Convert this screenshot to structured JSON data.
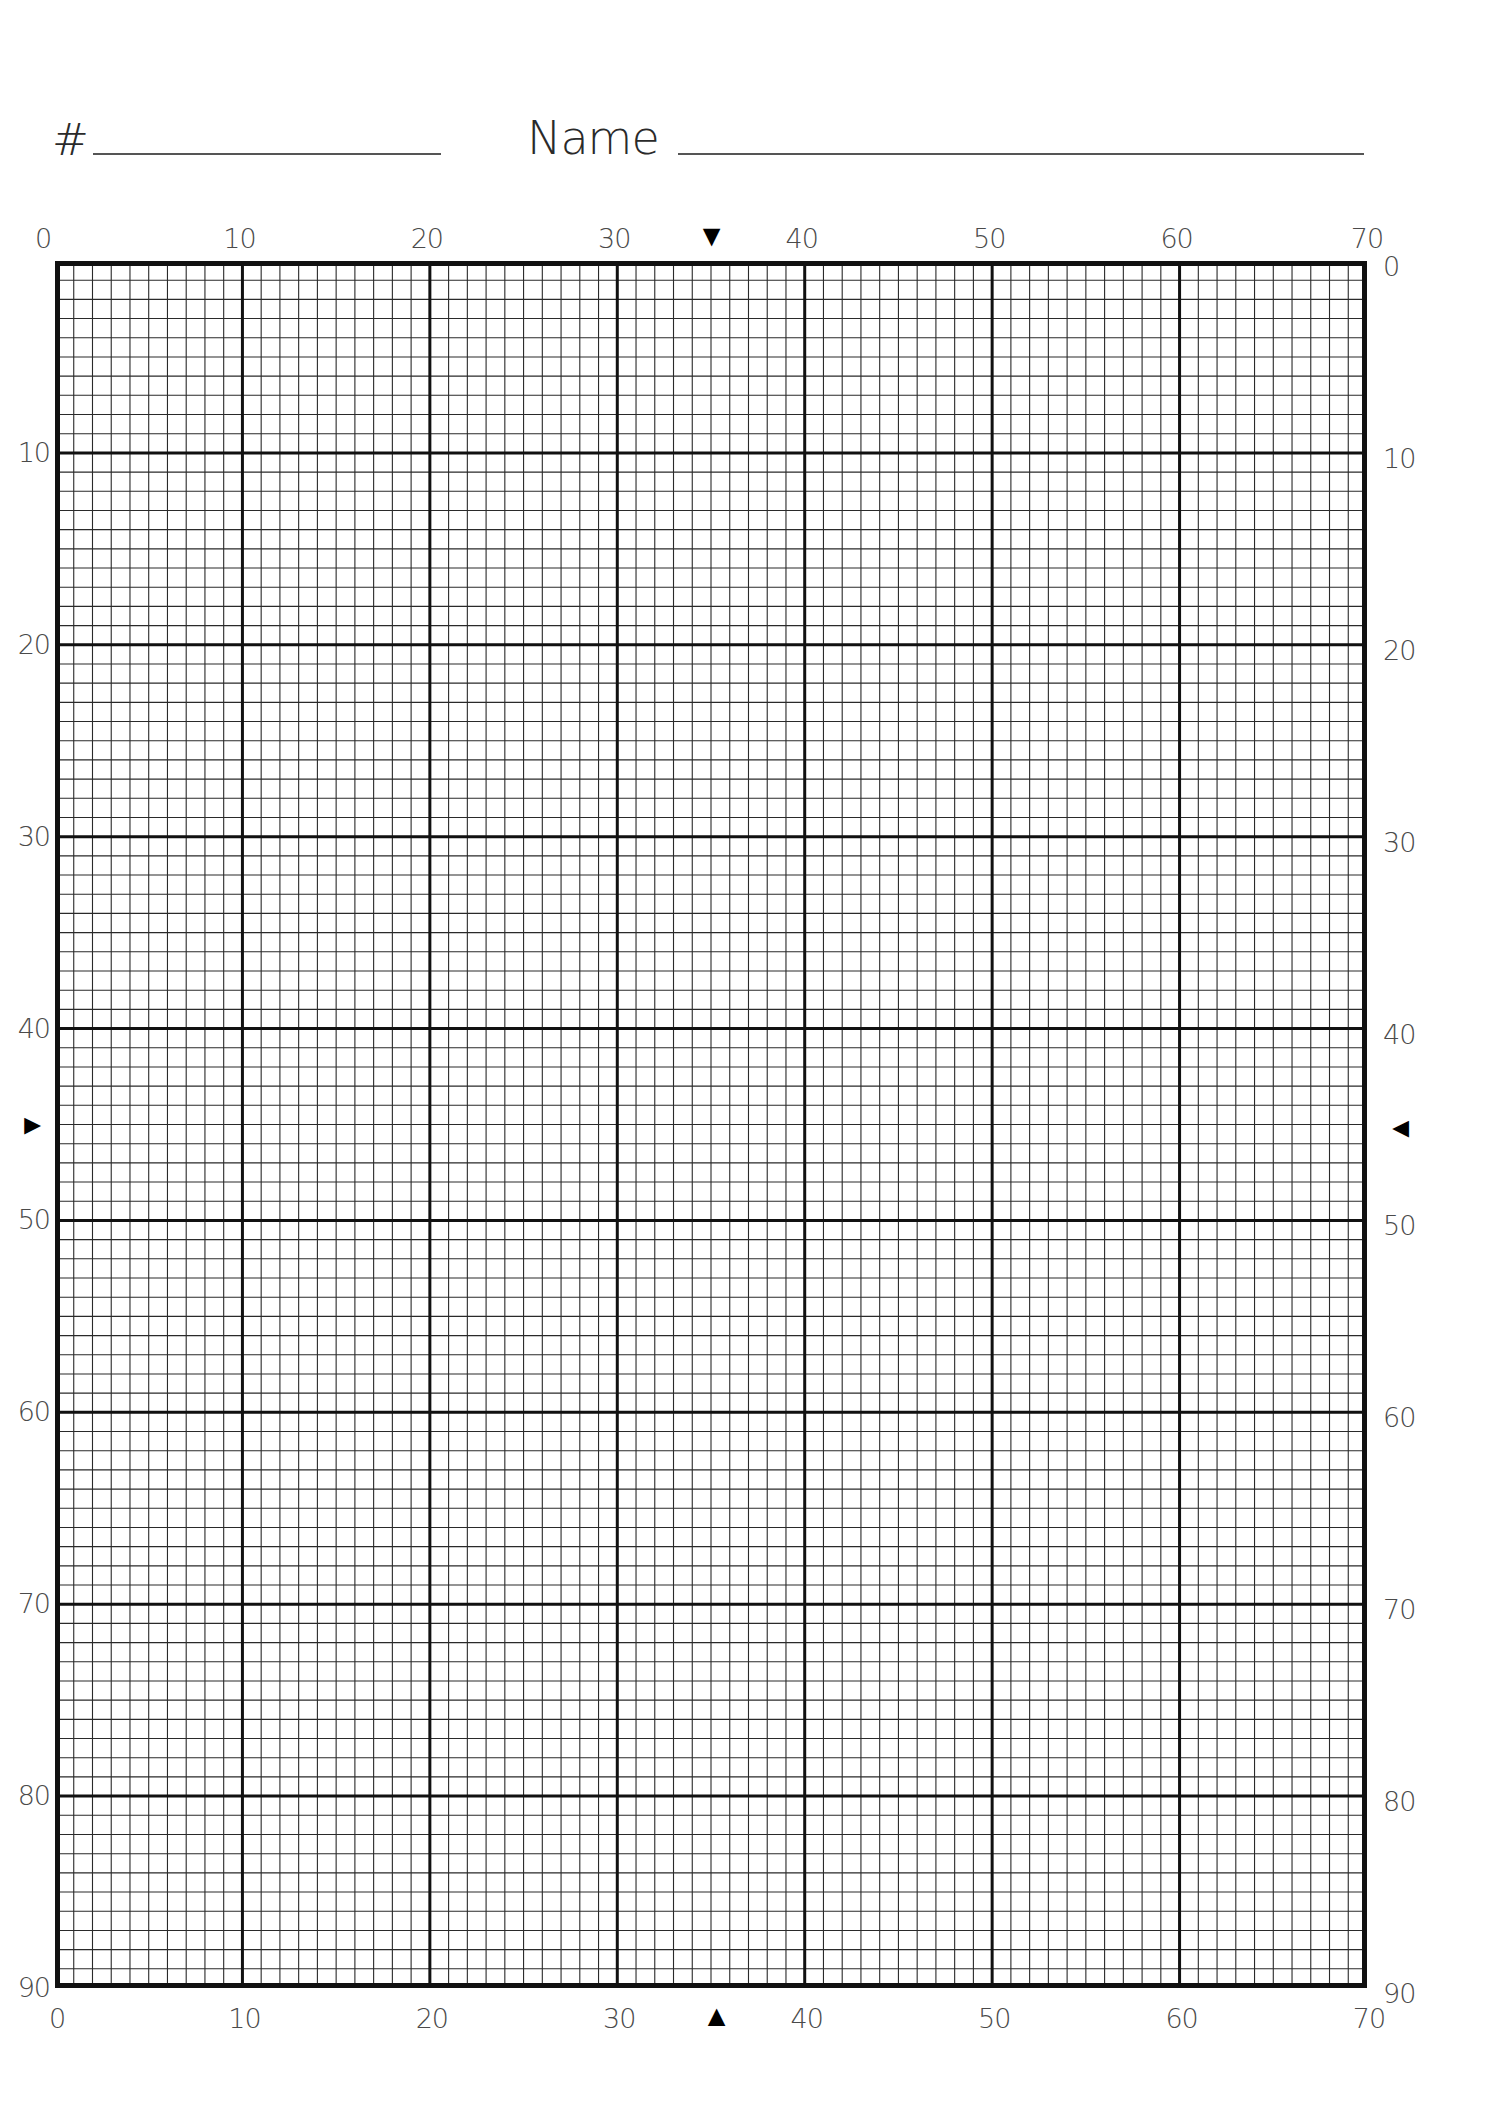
{
  "header": {
    "number_label": "#",
    "number_value": "",
    "name_label": "Name",
    "name_value": ""
  },
  "grid": {
    "columns": 70,
    "rows": 90,
    "major_every": 10,
    "line_color": "#111111",
    "top_labels": [
      "0",
      "10",
      "20",
      "30",
      "40",
      "50",
      "60",
      "70"
    ],
    "bottom_labels": [
      "0",
      "10",
      "20",
      "30",
      "40",
      "50",
      "60",
      "70"
    ],
    "left_labels": [
      "10",
      "20",
      "30",
      "40",
      "50",
      "60",
      "70",
      "80",
      "90"
    ],
    "right_labels": [
      "0",
      "10",
      "20",
      "30",
      "40",
      "50",
      "60",
      "70",
      "80",
      "90"
    ],
    "center_markers": {
      "top": "▼",
      "bottom": "▲",
      "left": "►",
      "right": "◄",
      "column_center": 35,
      "row_center": 45
    }
  }
}
